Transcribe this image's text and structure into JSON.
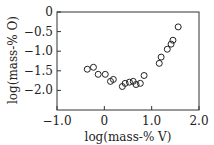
{
  "chart_data": {
    "type": "scatter",
    "title": "",
    "xlabel": "log(mass-% V)",
    "ylabel": "log(mass-% O)",
    "xlim": [
      -1.0,
      2.0
    ],
    "ylim": [
      -2.5,
      0
    ],
    "xticks": [
      -1.0,
      0,
      1.0,
      2.0
    ],
    "xtick_labels": [
      "−1.0",
      "0",
      "1.0",
      "2.0"
    ],
    "yticks": [
      0,
      -0.5,
      -1.0,
      -1.5,
      -2.0
    ],
    "ytick_labels": [
      "0",
      "−0.5",
      "−1.0",
      "−1.5",
      "−2.0"
    ],
    "grid": false,
    "legend": null,
    "marker": "open-circle",
    "series": [
      {
        "name": "data",
        "x": [
          -0.36,
          -0.23,
          -0.13,
          0.02,
          0.13,
          0.19,
          0.38,
          0.44,
          0.53,
          0.61,
          0.67,
          0.76,
          0.84,
          1.16,
          1.2,
          1.33,
          1.41,
          1.45,
          1.56
        ],
        "y": [
          -1.46,
          -1.41,
          -1.59,
          -1.59,
          -1.77,
          -1.72,
          -1.9,
          -1.82,
          -1.79,
          -1.77,
          -1.85,
          -1.82,
          -1.62,
          -1.31,
          -1.15,
          -0.95,
          -0.82,
          -0.72,
          -0.38
        ]
      }
    ]
  }
}
